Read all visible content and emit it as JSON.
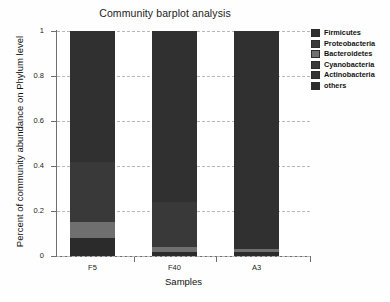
{
  "chart_data": {
    "type": "bar",
    "subtype": "stacked-bar",
    "title": "Community barplot analysis",
    "xlabel": "Samples",
    "ylabel": "Percent of community abundance on Phylum level",
    "categories": [
      "F5",
      "F40",
      "A3"
    ],
    "ylim": [
      0,
      1
    ],
    "yticks": [
      "0",
      "0.2",
      "0.4",
      "0.6",
      "0.8",
      "1"
    ],
    "ytick_values": [
      0,
      0.2,
      0.4,
      0.6,
      0.8,
      1
    ],
    "grid": true,
    "grid_style": "dashed-horizontal",
    "legend_position": "right",
    "stack_order": "bottom-to-top: others, Actinobacteria, Cyanobacteria, Bacteroidetes, Proteobacteria, Firmicutes",
    "series": [
      {
        "name": "others",
        "color": "#2b2b2b",
        "values": [
          0.08,
          0.02,
          0.02
        ]
      },
      {
        "name": "Actinobacteria",
        "color": "#343434",
        "values": [
          0.0,
          0.0,
          0.0
        ]
      },
      {
        "name": "Cyanobacteria",
        "color": "#3a3a3a",
        "values": [
          0.0,
          0.0,
          0.0
        ]
      },
      {
        "name": "Bacteroidetes",
        "color": "#6f6f6f",
        "values": [
          0.07,
          0.02,
          0.01
        ]
      },
      {
        "name": "Proteobacteria",
        "color": "#393939",
        "values": [
          0.27,
          0.2,
          0.0
        ]
      },
      {
        "name": "Firmicutes",
        "color": "#303030",
        "values": [
          0.58,
          0.76,
          0.97
        ]
      }
    ]
  },
  "legend": {
    "items": [
      {
        "label": "Firmicutes",
        "color": "#303030"
      },
      {
        "label": "Proteobacteria",
        "color": "#393939"
      },
      {
        "label": "Bacteroidetes",
        "color": "#6f6f6f"
      },
      {
        "label": "Cyanobacteria",
        "color": "#3a3a3a"
      },
      {
        "label": "Actinobacteria",
        "color": "#343434"
      },
      {
        "label": "others",
        "color": "#2b2b2b"
      }
    ]
  }
}
